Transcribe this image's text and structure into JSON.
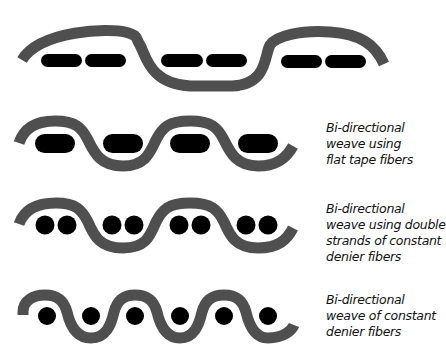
{
  "colors": {
    "yarn": "#4f4f4f",
    "fiber": "#000000",
    "background": "#ffffff",
    "text": "#111111"
  },
  "rows": [
    {
      "id": "row-1",
      "label_lines": [],
      "fiber_type": "flat-tape-pairs-wide",
      "fiber_count": 6
    },
    {
      "id": "row-2",
      "label_lines": [
        "Bi-directional",
        "weave using",
        "flat tape fibers"
      ],
      "fiber_type": "flat-tape",
      "fiber_count": 4
    },
    {
      "id": "row-3",
      "label_lines": [
        "Bi-directional",
        "weave using double",
        "strands of constant",
        "denier fibers"
      ],
      "fiber_type": "double-round-strands",
      "fiber_count": 8
    },
    {
      "id": "row-4",
      "label_lines": [
        "Bi-directional",
        "weave of constant",
        "denier fibers"
      ],
      "fiber_type": "single-round-strands",
      "fiber_count": 6
    }
  ]
}
